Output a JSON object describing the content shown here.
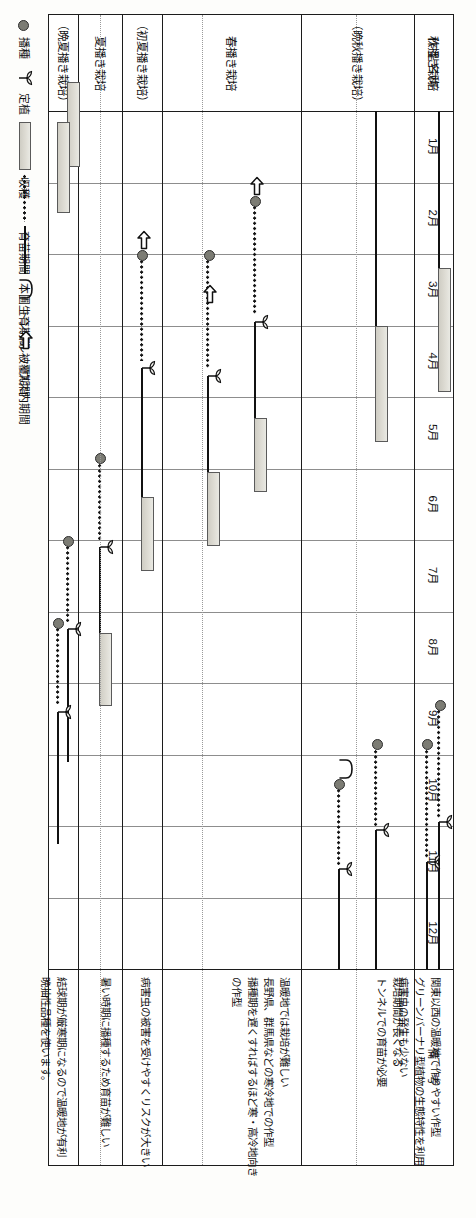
{
  "table": {
    "col_header_name": "作型名称",
    "col_header_remarks": "備　考",
    "months": [
      "1月",
      "2月",
      "3月",
      "4月",
      "5月",
      "6月",
      "7月",
      "8月",
      "9月",
      "10月",
      "11月",
      "12月"
    ],
    "rows": [
      {
        "label": "秋播き栽培",
        "remarks": [
          "関東以西の温暖地で作りやすい作型",
          "グリーンバーナリ型植物の生態特性を利用",
          "病害虫の発生も少ない"
        ],
        "seed_month": 9.3,
        "nursery": [
          9.3,
          10.9
        ],
        "transplant_month": 10.95,
        "field": [
          10.95,
          16.5
        ],
        "harvest": [
          15.3,
          16.5
        ]
      },
      {
        "label": "（晩秋播き栽培）",
        "remarks": [
          "栽培期間が長くなる",
          "トンネルでの育苗が必要"
        ],
        "seed_month": 9.85,
        "nursery": [
          9.85,
          11.0
        ],
        "transplant_month": 11.05,
        "field": [
          11.05,
          15.4
        ],
        "harvest": [
          14.3,
          15.4
        ],
        "tunnel_month": 10.2
      },
      {
        "label": "春播き栽培",
        "remarks": [
          "温暖地では栽培が難しい",
          "長野県、群馬県などの寒冷地での作型",
          "播種期を遅くすればするほど寒・高冷地向き",
          "の作型"
        ],
        "seed_month": 2.25,
        "nursery": [
          2.25,
          3.85
        ],
        "transplant_month": 3.95,
        "field": [
          3.95,
          6.3
        ],
        "harvest": [
          5.3,
          6.3
        ],
        "house": [
          1.3,
          3.85
        ]
      },
      {
        "label": "（初夏播き栽培）",
        "remarks": [
          "病害虫の被害を受けやすくリスクが大きい"
        ],
        "seed_month": 3.0,
        "nursery": [
          3.0,
          4.5
        ],
        "transplant_month": 4.6,
        "field": [
          4.6,
          7.4
        ],
        "harvest": [
          6.4,
          7.4
        ],
        "house": [
          2.1,
          4.5
        ]
      },
      {
        "label": "夏播き栽培",
        "remarks": [
          "暑い時期に播種するため育苗が難しい"
        ],
        "seed_month": 5.85,
        "nursery": [
          5.85,
          7.0
        ],
        "transplant_month": 7.1,
        "field": [
          7.1,
          9.3
        ],
        "harvest": [
          8.3,
          9.3
        ]
      },
      {
        "label": "（晩夏播き栽培）",
        "remarks": [
          "結球期が厳寒期になるので温暖地が有利",
          "晩抽性品種を使います。"
        ],
        "seed_month": 7.0,
        "nursery": [
          7.0,
          8.15
        ],
        "transplant_month": 8.25,
        "field": [
          0.55,
          1.6
        ],
        "field2": [
          8.25,
          10.1
        ],
        "harvest": [
          0.55,
          1.6
        ]
      }
    ]
  },
  "legend": {
    "items": [
      {
        "icon": "seed-dot-icon",
        "label": "播種"
      },
      {
        "icon": "seedling-icon",
        "label": "定植"
      },
      {
        "icon": "harvest-bar-icon",
        "label": "収穫"
      },
      {
        "icon": "dotted-line-icon",
        "label": "育苗期間"
      },
      {
        "icon": "solid-line-icon",
        "label": "本圃生育期間"
      },
      {
        "icon": "tunnel-arc-icon",
        "label": "トンネル被覆期間"
      },
      {
        "icon": "house-arrow-icon",
        "label": "ハウス内期間"
      }
    ]
  },
  "colors": {
    "ink": "#111111",
    "grid": "#8d8d8d",
    "harvest_fill": "#dedcd4",
    "seed_fill": "#7c7c74"
  }
}
